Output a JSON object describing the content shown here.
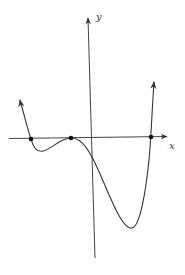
{
  "diagram": {
    "type": "polynomial-graph",
    "axes": {
      "x_label": "x",
      "y_label": "y"
    },
    "colors": {
      "stroke": "#333333",
      "point": "#111111",
      "background": "#ffffff"
    },
    "marked_points": [
      {
        "name": "left-root",
        "px": 31,
        "py": 139
      },
      {
        "name": "double-root",
        "px": 71,
        "py": 138
      },
      {
        "name": "right-root",
        "px": 151,
        "py": 137
      }
    ],
    "curve_features": {
      "left_end": "rises to +infinity (arrow)",
      "right_end": "rises to +infinity (arrow)",
      "local_min_left": "small dip between left root and double root",
      "tangent_root": "touches x-axis at double root",
      "global_min": "deep minimum right of y-axis"
    }
  }
}
